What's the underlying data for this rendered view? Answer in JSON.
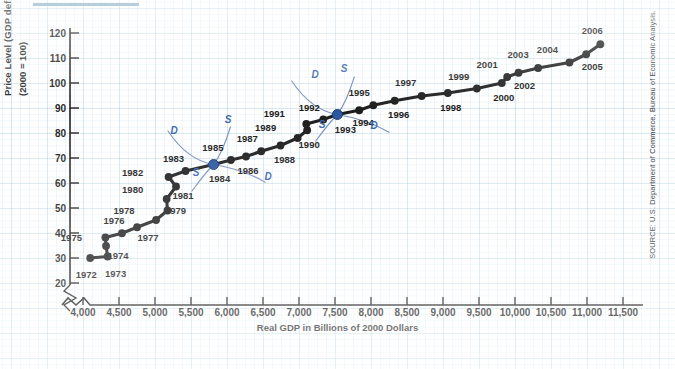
{
  "figure": {
    "y_axis_title_line1": "Price Level (GDP deflator)",
    "y_axis_title_line2": "(2000 = 100)",
    "x_axis_title": "Real GDP in Billions of 2000 Dollars",
    "source_note": "SOURCE: U.S. Department of Commerce, Bureau of Economic Analysis.",
    "accent_color": "#2f5fa8",
    "grid_color": "#96c3d7",
    "series_color": "#101010"
  },
  "chart_data": {
    "type": "scatter",
    "title": "",
    "xlabel": "Real GDP in Billions of 2000 Dollars",
    "ylabel": "Price Level (GDP deflator) (2000 = 100)",
    "xlim": [
      3750,
      11500
    ],
    "ylim": [
      15,
      125
    ],
    "x_ticks": [
      "4,000",
      "4,500",
      "5,000",
      "5,500",
      "6,000",
      "6,500",
      "7,000",
      "7,500",
      "8,000",
      "8,500",
      "9,000",
      "9,500",
      "10,000",
      "10,500",
      "11,000",
      "11,500"
    ],
    "x_tick_values": [
      4000,
      4500,
      5000,
      5500,
      6000,
      6500,
      7000,
      7500,
      8000,
      8500,
      9000,
      9500,
      10000,
      10500,
      11000,
      11500
    ],
    "y_ticks": [
      "20",
      "30",
      "40",
      "50",
      "60",
      "70",
      "80",
      "90",
      "100",
      "110",
      "120"
    ],
    "y_tick_values": [
      20,
      30,
      40,
      50,
      60,
      70,
      80,
      90,
      100,
      110,
      120
    ],
    "axis_break": true,
    "grid": true,
    "legend": "none",
    "point_label_key": "year",
    "points": [
      {
        "year": "1972",
        "x": 4100,
        "y": 30.0,
        "label_dx": -4,
        "label_dy": 20,
        "highlight": false
      },
      {
        "year": "1973",
        "x": 4342,
        "y": 30.6,
        "label_dx": 8,
        "label_dy": 20,
        "highlight": false
      },
      {
        "year": "1974",
        "x": 4320,
        "y": 34.8,
        "label_dx": 12,
        "label_dy": 13,
        "highlight": false
      },
      {
        "year": "1975",
        "x": 4311,
        "y": 38.2,
        "label_dx": -34,
        "label_dy": 3,
        "highlight": false
      },
      {
        "year": "1976",
        "x": 4541,
        "y": 39.9,
        "label_dx": -8,
        "label_dy": -9,
        "highlight": false
      },
      {
        "year": "1977",
        "x": 4751,
        "y": 42.3,
        "label_dx": 11,
        "label_dy": 14,
        "highlight": false
      },
      {
        "year": "1978",
        "x": 5015,
        "y": 45.2,
        "label_dx": -32,
        "label_dy": -6,
        "highlight": false
      },
      {
        "year": "1979",
        "x": 5173,
        "y": 49.0,
        "label_dx": 8,
        "label_dy": 3,
        "highlight": false
      },
      {
        "year": "1980",
        "x": 5162,
        "y": 53.6,
        "label_dx": -34,
        "label_dy": -6,
        "highlight": false
      },
      {
        "year": "1981",
        "x": 5292,
        "y": 58.6,
        "label_dx": 7,
        "label_dy": 12,
        "highlight": false
      },
      {
        "year": "1982",
        "x": 5189,
        "y": 62.4,
        "label_dx": -36,
        "label_dy": -1,
        "highlight": false
      },
      {
        "year": "1983",
        "x": 5424,
        "y": 64.8,
        "label_dx": -12,
        "label_dy": -9,
        "highlight": false
      },
      {
        "year": "1984",
        "x": 5814,
        "y": 67.4,
        "label_dx": 6,
        "label_dy": 17,
        "highlight": true
      },
      {
        "year": "1985",
        "x": 6054,
        "y": 69.2,
        "label_dx": -18,
        "label_dy": -9,
        "highlight": false
      },
      {
        "year": "1986",
        "x": 6264,
        "y": 70.6,
        "label_dx": 2,
        "label_dy": 17,
        "highlight": false
      },
      {
        "year": "1987",
        "x": 6475,
        "y": 72.7,
        "label_dx": -14,
        "label_dy": -9,
        "highlight": false
      },
      {
        "year": "1988",
        "x": 6743,
        "y": 75.0,
        "label_dx": 4,
        "label_dy": 17,
        "highlight": false
      },
      {
        "year": "1989",
        "x": 6981,
        "y": 78.0,
        "label_dx": -32,
        "label_dy": -7,
        "highlight": false
      },
      {
        "year": "1990",
        "x": 7113,
        "y": 81.1,
        "label_dx": 2,
        "label_dy": 18,
        "highlight": false
      },
      {
        "year": "1991",
        "x": 7101,
        "y": 83.6,
        "label_dx": -32,
        "label_dy": -7,
        "highlight": false
      },
      {
        "year": "1992",
        "x": 7337,
        "y": 85.4,
        "label_dx": -14,
        "label_dy": -9,
        "highlight": false
      },
      {
        "year": "1993",
        "x": 7533,
        "y": 87.4,
        "label_dx": 8,
        "label_dy": 18,
        "highlight": true
      },
      {
        "year": "1994",
        "x": 7836,
        "y": 89.1,
        "label_dx": 4,
        "label_dy": 16,
        "highlight": false
      },
      {
        "year": "1995",
        "x": 8032,
        "y": 91.1,
        "label_dx": -14,
        "label_dy": -9,
        "highlight": false
      },
      {
        "year": "1996",
        "x": 8329,
        "y": 92.9,
        "label_dx": 4,
        "label_dy": 17,
        "highlight": false
      },
      {
        "year": "1997",
        "x": 8704,
        "y": 94.8,
        "label_dx": -16,
        "label_dy": -10,
        "highlight": false
      },
      {
        "year": "1998",
        "x": 9067,
        "y": 96.0,
        "label_dx": 3,
        "label_dy": 18,
        "highlight": false
      },
      {
        "year": "1999",
        "x": 9470,
        "y": 97.8,
        "label_dx": -18,
        "label_dy": -9,
        "highlight": false
      },
      {
        "year": "2000",
        "x": 9817,
        "y": 100.0,
        "label_dx": 2,
        "label_dy": 18,
        "highlight": false
      },
      {
        "year": "2001",
        "x": 9891,
        "y": 102.4,
        "label_dx": -20,
        "label_dy": -9,
        "highlight": false
      },
      {
        "year": "2002",
        "x": 10049,
        "y": 104.1,
        "label_dx": 6,
        "label_dy": 16,
        "highlight": false
      },
      {
        "year": "2003",
        "x": 10321,
        "y": 106.0,
        "label_dx": -20,
        "label_dy": -10,
        "highlight": false
      },
      {
        "year": "2004",
        "x": 10756,
        "y": 108.2,
        "label_dx": -22,
        "label_dy": -10,
        "highlight": false
      },
      {
        "year": "2005",
        "x": 10989,
        "y": 111.5,
        "label_dx": 6,
        "label_dy": 16,
        "highlight": false
      },
      {
        "year": "2006",
        "x": 11185,
        "y": 115.5,
        "label_dx": -8,
        "label_dy": -10,
        "highlight": false
      }
    ],
    "annotations": [
      {
        "name": "D-curve-1985",
        "text": "D",
        "tx": 174,
        "ty": 134
      },
      {
        "name": "S-curve-1985",
        "text": "S",
        "tx": 228,
        "ty": 123
      },
      {
        "name": "S-label-1985-lower",
        "text": "S",
        "tx": 196,
        "ty": 176
      },
      {
        "name": "D-label-1985-lower",
        "text": "D",
        "tx": 268,
        "ty": 180
      },
      {
        "name": "D-curve-1993",
        "text": "D",
        "tx": 315,
        "ty": 78
      },
      {
        "name": "S-curve-1993",
        "text": "S",
        "tx": 344,
        "ty": 72
      },
      {
        "name": "S-label-1993-lower",
        "text": "S",
        "tx": 322,
        "ty": 128
      },
      {
        "name": "D-label-1993-lower",
        "text": "D",
        "tx": 374,
        "ty": 129
      }
    ]
  }
}
